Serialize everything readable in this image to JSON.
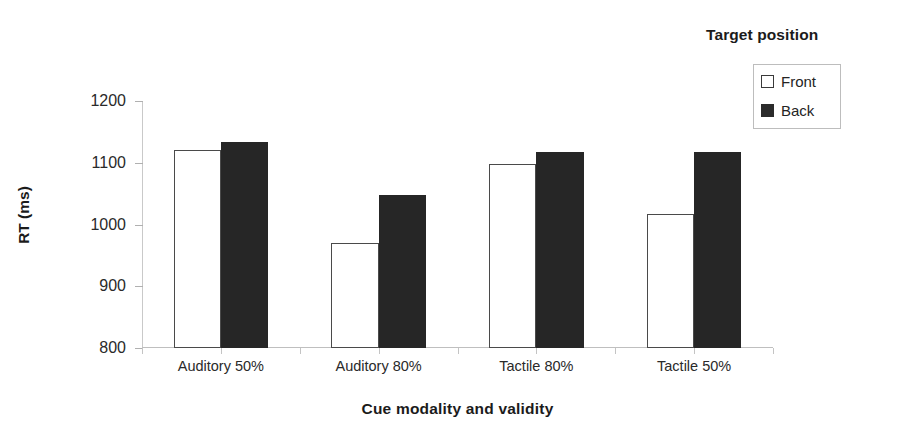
{
  "chart_data": {
    "type": "bar",
    "title": "",
    "xlabel": "Cue modality and validity",
    "ylabel": "RT (ms)",
    "categories": [
      "Auditory 50%",
      "Auditory 80%",
      "Tactile 80%",
      "Tactile 50%"
    ],
    "series": [
      {
        "name": "Front",
        "values": [
          1120,
          970,
          1098,
          1017
        ],
        "color": "#ffffff",
        "edge_color": "#4a4a4a"
      },
      {
        "name": "Back",
        "values": [
          1134,
          1048,
          1117,
          1117
        ],
        "color": "#262626",
        "edge_color": "#262626"
      }
    ],
    "ylim": [
      800,
      1200
    ],
    "yticks": [
      800,
      900,
      1000,
      1100,
      1200
    ],
    "ytick_labels": [
      "800",
      "900",
      "1000",
      "1100",
      "1200"
    ],
    "grid": false,
    "legend_position": "top-right",
    "legend": {
      "title": "Target position",
      "entries": [
        {
          "label": "Front",
          "swatch": "open-square"
        },
        {
          "label": "Back",
          "swatch": "filled-square"
        }
      ]
    }
  }
}
